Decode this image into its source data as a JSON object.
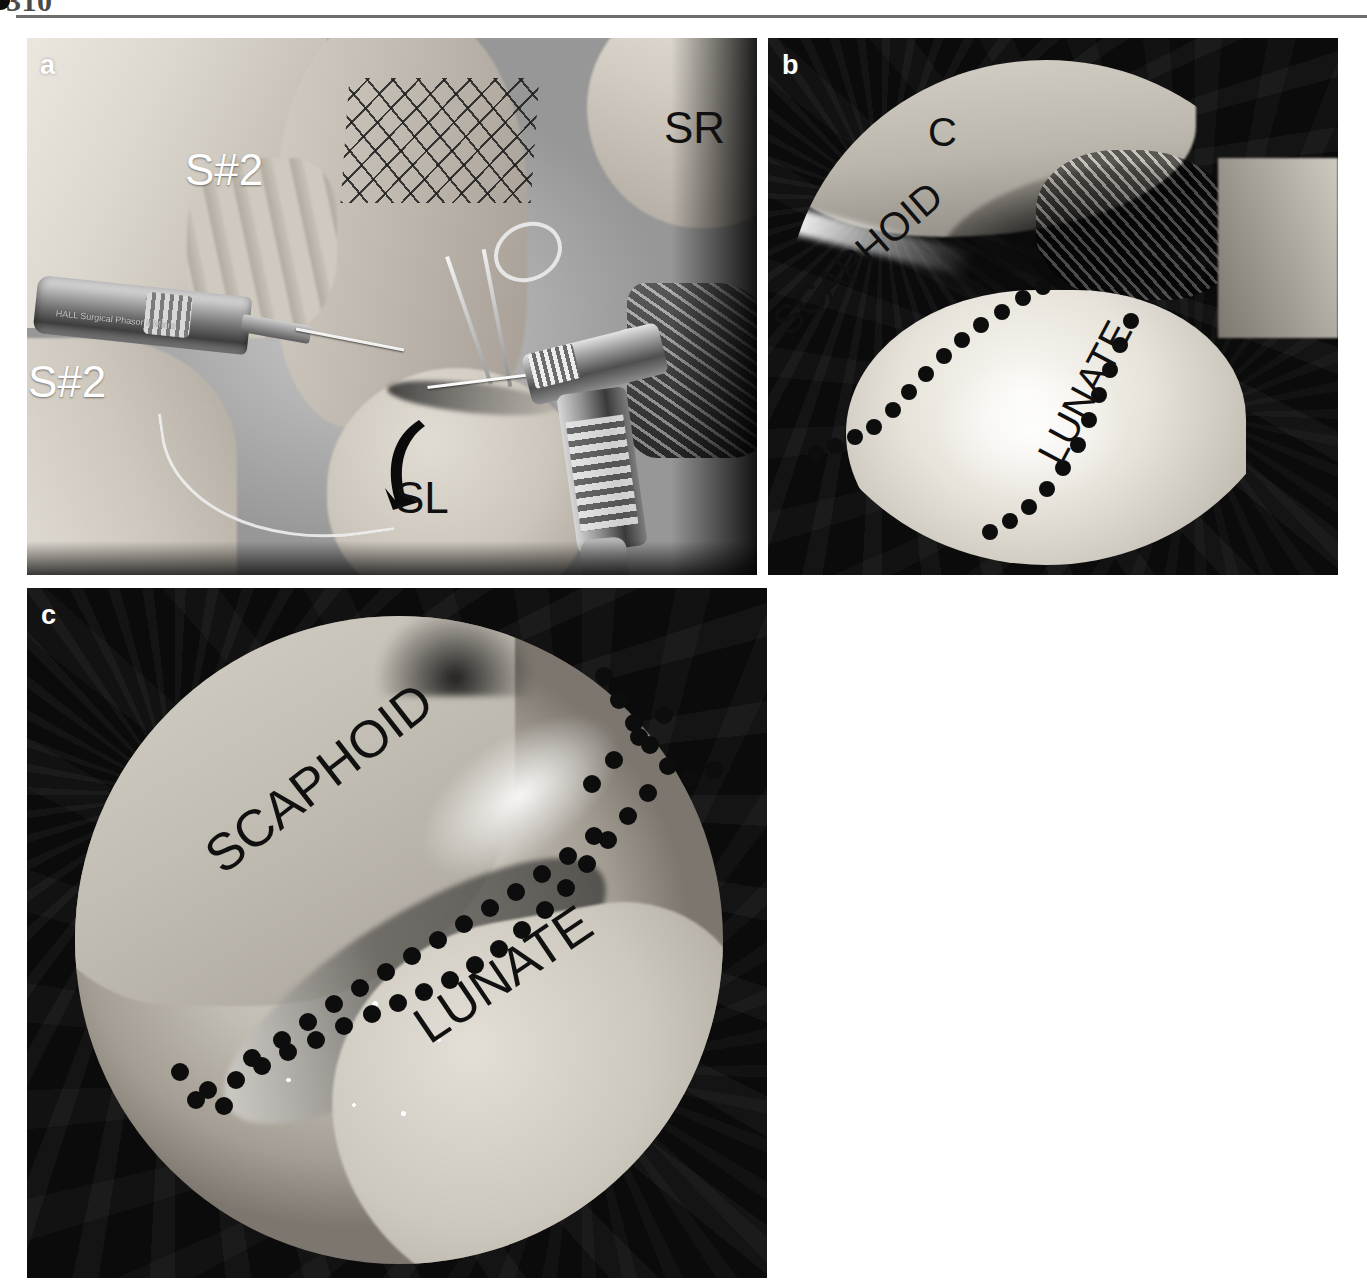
{
  "page": {
    "folio": "310",
    "rule_color": "#6e6e6e"
  },
  "figure": {
    "panels": [
      {
        "id": "a",
        "letter": "a",
        "letter_color": "#ffffff",
        "caption_type": "intraoperative-photograph",
        "description": "Open dorsal wrist approach with power drill, guide wire and reduction forceps",
        "labels": [
          {
            "text": "S#2",
            "color": "#ffffff",
            "left": 185,
            "top": 148,
            "size": 44
          },
          {
            "text": "S#2",
            "color": "#ffffff",
            "left": 28,
            "top": 360,
            "size": 44
          },
          {
            "text": "SR",
            "color": "#101010",
            "left": 664,
            "top": 106,
            "size": 44
          },
          {
            "text": "SL",
            "color": "#101010",
            "left": 395,
            "top": 476,
            "size": 44
          }
        ],
        "instrument_text": "HALL Surgical  Phasor II Micro"
      },
      {
        "id": "b",
        "letter": "b",
        "letter_color": "#ffffff",
        "caption_type": "arthroscopic-view",
        "description": "Midcarpal arthroscopic view of the scapholunate interval",
        "labels": [
          {
            "text": "C",
            "color": "#101010",
            "left": 928,
            "top": 112,
            "size": 40,
            "rotate": 0
          },
          {
            "text": "SCAPHOID",
            "color": "#101010",
            "left": 792,
            "top": 302,
            "size": 40,
            "rotate": -41
          },
          {
            "text": "LUNATE",
            "color": "#101010",
            "left": 1066,
            "top": 430,
            "size": 40,
            "rotate": -62
          }
        ]
      },
      {
        "id": "c",
        "letter": "c",
        "letter_color": "#ffffff",
        "caption_type": "arthroscopic-view",
        "description": "Arthroscopic view demonstrating the reduced scapholunate interval",
        "labels": [
          {
            "text": "SCAPHOID",
            "color": "#101010",
            "left": 228,
            "top": 830,
            "size": 52,
            "rotate": -38
          },
          {
            "text": "LUNATE",
            "color": "#101010",
            "left": 434,
            "top": 1000,
            "size": 52,
            "rotate": -34
          }
        ]
      }
    ],
    "abbreviations": {
      "C": "capitate",
      "SR": "scaphoid reduction instrument",
      "SL": "scapholunate",
      "S#2": "suture anchor number 2",
      "SCAPHOID": "scaphoid",
      "LUNATE": "lunate"
    },
    "marker_color": "#0d0d0d"
  }
}
